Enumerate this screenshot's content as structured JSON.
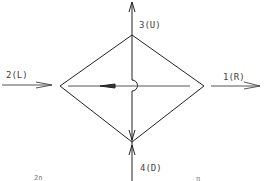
{
  "diagram": {
    "type": "flow-junction",
    "shape": "diamond",
    "ports": [
      {
        "id": "1",
        "direction": "R",
        "label": "1(R)",
        "flow": "out"
      },
      {
        "id": "2",
        "direction": "L",
        "label": "2(L)",
        "flow": "in"
      },
      {
        "id": "3",
        "direction": "U",
        "label": "3(U)",
        "flow": "out"
      },
      {
        "id": "4",
        "direction": "D",
        "label": "4(D)",
        "flow": "in"
      }
    ],
    "footer": {
      "left_text": "2n",
      "right_text": "π"
    },
    "colors": {
      "line": "#222222",
      "text": "#444444",
      "background": "#ffffff"
    }
  }
}
